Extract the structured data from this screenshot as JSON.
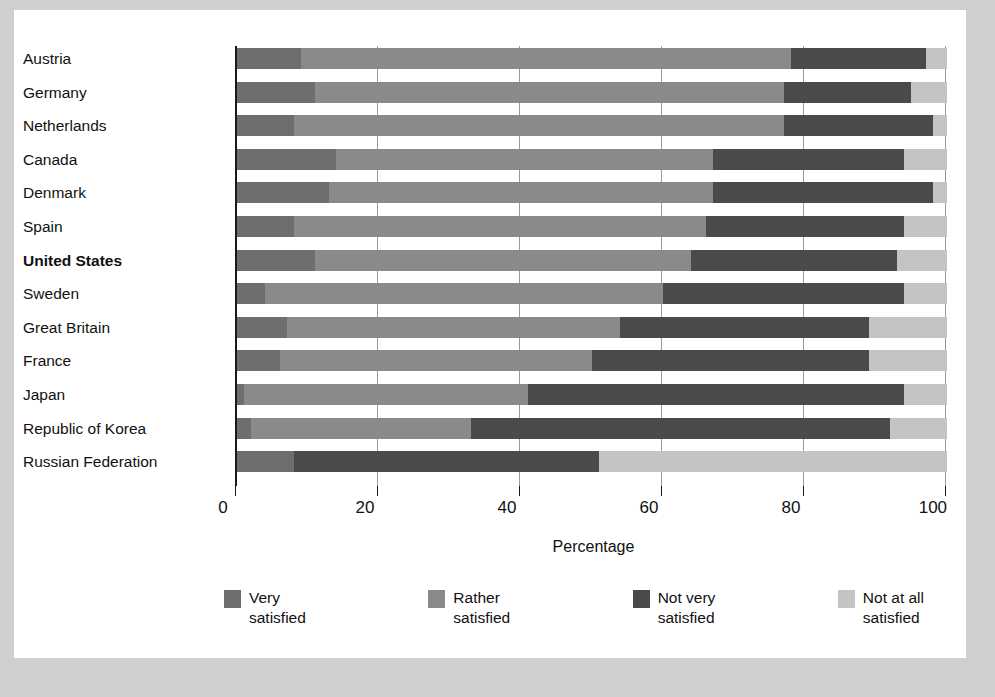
{
  "chart_data": {
    "type": "bar",
    "orientation": "horizontal",
    "stacked": true,
    "title": "",
    "xlabel": "Percentage",
    "ylabel": "",
    "xlim": [
      0,
      101
    ],
    "xticks": [
      0,
      20,
      40,
      60,
      80,
      100
    ],
    "xtick_labels": [
      "0",
      "20",
      "40",
      "60",
      "80",
      "100"
    ],
    "grid": "vertical",
    "legend_position": "bottom",
    "categories": [
      "Austria",
      "Germany",
      "Netherlands",
      "Canada",
      "Denmark",
      "Spain",
      "United States",
      "Sweden",
      "Great Britain",
      "France",
      "Japan",
      "Republic of Korea",
      "Russian Federation"
    ],
    "highlighted_category": "United States",
    "series": [
      {
        "name": "Very satisfied",
        "color": "#6e6e6e",
        "values": [
          9,
          11,
          8,
          14,
          13,
          8,
          11,
          4,
          7,
          6,
          1,
          2,
          8
        ]
      },
      {
        "name": "Rather satisfied",
        "color": "#8a8a8a",
        "values": [
          69,
          66,
          69,
          53,
          54,
          58,
          53,
          56,
          47,
          44,
          40,
          31,
          0
        ]
      },
      {
        "name": "Not very satisfied",
        "color": "#4a4a4a",
        "values": [
          19,
          18,
          21,
          27,
          31,
          28,
          29,
          34,
          35,
          39,
          53,
          59,
          43
        ]
      },
      {
        "name": "Not at all satisfied",
        "color": "#c4c4c4",
        "values": [
          3,
          5,
          2,
          6,
          2,
          6,
          7,
          6,
          11,
          11,
          6,
          8,
          49
        ]
      }
    ]
  },
  "legend": {
    "items": [
      {
        "label": "Very\nsatisfied",
        "color": "#6e6e6e"
      },
      {
        "label": "Rather\nsatisfied",
        "color": "#8a8a8a"
      },
      {
        "label": "Not very\nsatisfied",
        "color": "#4a4a4a"
      },
      {
        "label": "Not at all\nsatisfied",
        "color": "#c4c4c4"
      }
    ]
  }
}
